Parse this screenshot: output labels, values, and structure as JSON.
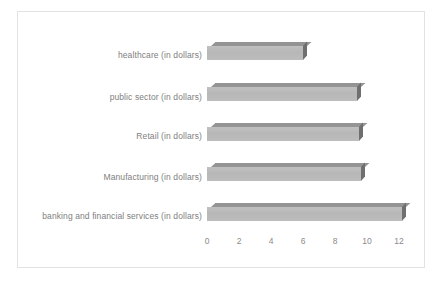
{
  "chart_data": {
    "type": "bar",
    "orientation": "horizontal",
    "title": "",
    "subtitle": "",
    "xlabel": "",
    "ylabel": "",
    "grid": false,
    "legend": false,
    "legend_position": "none",
    "xlim": [
      0,
      12
    ],
    "xticks": [
      "0",
      "2",
      "4",
      "6",
      "8",
      "10",
      "12"
    ],
    "categories": [
      "healthcare  (in dollars)",
      "public sector  (in dollars)",
      "Retail  (in dollars)",
      "Manufacturing  (in dollars)",
      "banking and financial services (in dollars)"
    ],
    "values": [
      6,
      9.4,
      9.5,
      9.6,
      12.2
    ],
    "colors": {
      "bar_face": "#b9b9b9",
      "bar_top": "#949494",
      "bar_side": "#6f6f6f",
      "text": "#808080",
      "tick_text": "#8a8a8a",
      "border": "#e2e2e2",
      "background": "#ffffff"
    }
  }
}
